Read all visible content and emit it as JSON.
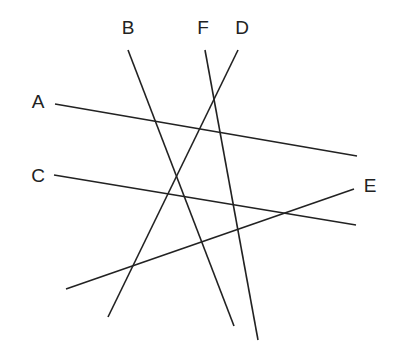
{
  "diagram": {
    "type": "line-intersections",
    "line_color": "#222222",
    "label_color": "#222222",
    "lines": [
      {
        "label": "A",
        "x1": 55,
        "y1": 104,
        "x2": 357,
        "y2": 156,
        "label_x": 38,
        "label_y": 108
      },
      {
        "label": "B",
        "x1": 128,
        "y1": 50,
        "x2": 234,
        "y2": 326,
        "label_x": 128,
        "label_y": 34
      },
      {
        "label": "C",
        "x1": 54,
        "y1": 175,
        "x2": 356,
        "y2": 225,
        "label_x": 38,
        "label_y": 182
      },
      {
        "label": "D",
        "x1": 238,
        "y1": 50,
        "x2": 108,
        "y2": 317,
        "label_x": 242,
        "label_y": 34
      },
      {
        "label": "E",
        "x1": 66,
        "y1": 289,
        "x2": 354,
        "y2": 189,
        "label_x": 370,
        "label_y": 192
      },
      {
        "label": "F",
        "x1": 205,
        "y1": 50,
        "x2": 258,
        "y2": 340,
        "label_x": 203,
        "label_y": 34
      }
    ]
  }
}
